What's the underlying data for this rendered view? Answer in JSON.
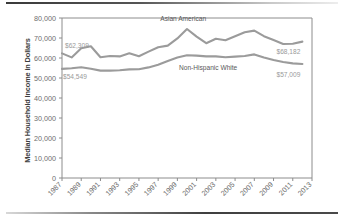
{
  "figure": {
    "ylabel": "Median Household Income in Dollars"
  },
  "chart_data": {
    "type": "line",
    "title": "",
    "xlabel": "",
    "ylabel": "Median Household Income in Dollars",
    "ylim": [
      0,
      80000
    ],
    "xlim": [
      1987,
      2013
    ],
    "grid": false,
    "legend_position": "inline-annotations",
    "ytick_labels": [
      "80,000",
      "70,000",
      "60,000",
      "50,000",
      "40,000",
      "30,000",
      "20,000",
      "10,000",
      "0"
    ],
    "ytick_values": [
      80000,
      70000,
      60000,
      50000,
      40000,
      30000,
      20000,
      10000,
      0
    ],
    "xtick_labels": [
      "1987",
      "1989",
      "1991",
      "1993",
      "1995",
      "1997",
      "1999",
      "2001",
      "2003",
      "2005",
      "2007",
      "2009",
      "2011",
      "2013"
    ],
    "xtick_values": [
      1987,
      1989,
      1991,
      1993,
      1995,
      1997,
      1999,
      2001,
      2003,
      2005,
      2007,
      2009,
      2011,
      2013
    ],
    "x": [
      1987,
      1988,
      1989,
      1990,
      1991,
      1992,
      1993,
      1994,
      1995,
      1996,
      1997,
      1998,
      1999,
      2000,
      2001,
      2002,
      2003,
      2004,
      2005,
      2006,
      2007,
      2008,
      2009,
      2010,
      2011,
      2012
    ],
    "series": [
      {
        "name": "Asian American",
        "color": "#9b9b9b",
        "values": [
          62309,
          60300,
          64900,
          65900,
          60400,
          61000,
          60800,
          62400,
          60900,
          63200,
          65400,
          66200,
          69800,
          74500,
          70700,
          67400,
          69600,
          68900,
          70900,
          72900,
          73700,
          70900,
          69000,
          67000,
          67100,
          68182
        ]
      },
      {
        "name": "Non-Hispanic White",
        "color": "#9b9b9b",
        "values": [
          54549,
          54900,
          55400,
          54600,
          53700,
          53700,
          53900,
          54300,
          54400,
          55300,
          56600,
          58500,
          60200,
          61400,
          61200,
          60800,
          60800,
          60400,
          60700,
          61000,
          61800,
          60200,
          59000,
          58000,
          57300,
          57009
        ]
      }
    ],
    "annotations": [
      {
        "name": "asian-american-start",
        "text": "$62,309",
        "x": 1987,
        "y": 62309
      },
      {
        "name": "asian-american-end",
        "text": "$68,182",
        "x": 2012,
        "y": 68182
      },
      {
        "name": "non-hispanic-white-start",
        "text": "$54,549",
        "x": 1987,
        "y": 54549
      },
      {
        "name": "non-hispanic-white-end",
        "text": "$57,009",
        "x": 2012,
        "y": 57009
      },
      {
        "name": "asian-american-series-label",
        "text": "Asian American"
      },
      {
        "name": "non-hispanic-white-series-label",
        "text": "Non-Hispanic White"
      }
    ]
  }
}
